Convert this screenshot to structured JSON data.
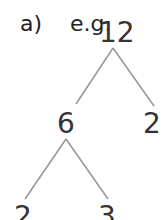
{
  "header": {
    "label": "a)",
    "example": "e.g."
  },
  "tree": {
    "root": {
      "value": "12"
    },
    "level1": [
      {
        "value": "6"
      },
      {
        "value": "2"
      }
    ],
    "level2": [
      {
        "value": "2"
      },
      {
        "value": "3"
      }
    ],
    "line_color": "#999999"
  }
}
